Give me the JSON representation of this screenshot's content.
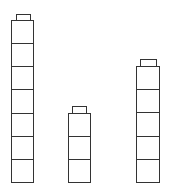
{
  "figure": {
    "line_color": "#333333",
    "background": "#ffffff",
    "stacks": [
      {
        "name": "left",
        "count": 7,
        "count_label": "7 cubes",
        "left": 11,
        "width": 23,
        "top": 20,
        "bottom": 182,
        "tab": {
          "left": 16,
          "width": 15,
          "top": 14,
          "height": 6
        }
      },
      {
        "name": "middle",
        "count": 3,
        "count_label": "3 cubes",
        "left": 68,
        "width": 23,
        "top": 113,
        "bottom": 182,
        "tab": {
          "left": 72,
          "width": 15,
          "top": 106,
          "height": 7
        }
      },
      {
        "name": "right",
        "count": 5,
        "count_label": "5 cubes",
        "left": 136,
        "width": 24,
        "top": 66,
        "bottom": 182,
        "tab": {
          "left": 140,
          "width": 17,
          "top": 59,
          "height": 7
        }
      }
    ]
  }
}
